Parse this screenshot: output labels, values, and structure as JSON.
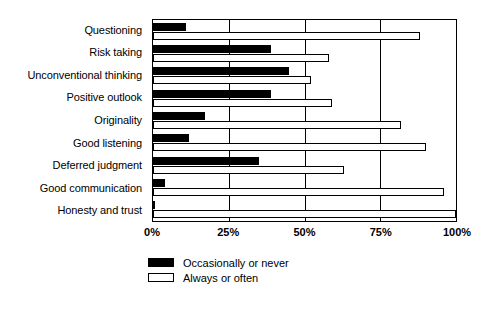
{
  "chart_data": {
    "type": "bar",
    "orientation": "horizontal",
    "title": "",
    "subtitle": "",
    "xlabel": "",
    "ylabel": "",
    "xlim": [
      0,
      100
    ],
    "xticks": [
      "0%",
      "25%",
      "50%",
      "75%",
      "100%"
    ],
    "xtick_values": [
      0,
      25,
      50,
      75,
      100
    ],
    "grid": true,
    "legend_position": "bottom-left",
    "categories": [
      "Questioning",
      "Risk taking",
      "Unconventional thinking",
      "Positive outlook",
      "Originality",
      "Good listening",
      "Deferred judgment",
      "Good communication",
      "Honesty and trust"
    ],
    "series": [
      {
        "name": "Occasionally or never",
        "color": "#000000",
        "style": "filled",
        "values": [
          11,
          39,
          45,
          39,
          17,
          12,
          35,
          4,
          0.5
        ]
      },
      {
        "name": "Always or often",
        "color": "#ffffff",
        "style": "outlined",
        "values": [
          88,
          58,
          52,
          59,
          82,
          90,
          63,
          96,
          100
        ]
      }
    ]
  },
  "legend": {
    "items": [
      {
        "label": "Occasionally or never",
        "swatch": "dark"
      },
      {
        "label": "Always or often",
        "swatch": "light"
      }
    ]
  }
}
